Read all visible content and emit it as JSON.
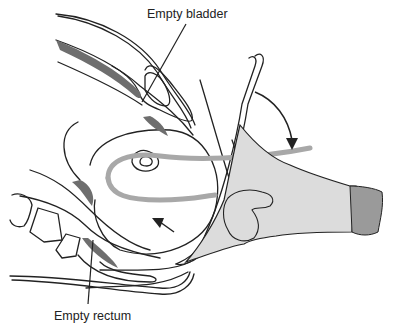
{
  "figure": {
    "type": "medical-anatomical-illustration",
    "labels": {
      "bladder": "Empty bladder",
      "rectum": "Empty rectum"
    },
    "colors": {
      "outline": "#222222",
      "tissue_dark": "#6e6e6e",
      "glove_fill": "#dcdcdc",
      "glove_cuff": "#9a9a9a",
      "catheter_band": "#a8a8a8",
      "background": "#ffffff"
    },
    "arrows": [
      {
        "name": "downward-curved-arrow",
        "direction": "down"
      },
      {
        "name": "upward-left-arrow",
        "direction": "up-left"
      }
    ]
  }
}
